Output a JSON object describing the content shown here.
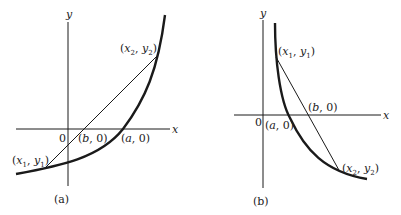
{
  "figures": [
    {
      "id": "a",
      "caption": "(a)",
      "axis_x_label": "x",
      "axis_y_label": "y",
      "origin_label": "0",
      "points": {
        "p1": {
          "label": "(x1, y1)",
          "name": "x",
          "sub": "1",
          "name2": "y",
          "sub2": "1"
        },
        "p2": {
          "label": "(x2, y2)",
          "name": "x",
          "sub": "2",
          "name2": "y",
          "sub2": "2"
        },
        "b": {
          "label": "(b, 0)"
        },
        "a": {
          "label": "(a, 0)"
        }
      }
    },
    {
      "id": "b",
      "caption": "(b)",
      "axis_x_label": "x",
      "axis_y_label": "y",
      "origin_label": "0",
      "points": {
        "p1": {
          "label": "(x1, y1)",
          "name": "x",
          "sub": "1",
          "name2": "y",
          "sub2": "1"
        },
        "p2": {
          "label": "(x2, y2)",
          "name": "x",
          "sub": "2",
          "name2": "y",
          "sub2": "2"
        },
        "b": {
          "label": "(b, 0)"
        },
        "a": {
          "label": "(a, 0)"
        }
      }
    }
  ],
  "colors": {
    "ink": "#1a1a1a",
    "background": "#ffffff"
  }
}
